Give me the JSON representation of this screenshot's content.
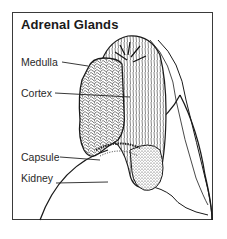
{
  "diagram": {
    "title": "Adrenal Glands",
    "labels": [
      {
        "text": "Medulla",
        "x": 21,
        "y": 61,
        "line_to": [
          88,
          66
        ]
      },
      {
        "text": "Cortex",
        "x": 21,
        "y": 92,
        "line_to": [
          78,
          97
        ]
      },
      {
        "text": "Capsule",
        "x": 21,
        "y": 156,
        "line_to": [
          100,
          160
        ]
      },
      {
        "text": "Kidney",
        "x": 21,
        "y": 177,
        "line_to": [
          108,
          182
        ]
      }
    ],
    "colors": {
      "ink": "#1a1a1a",
      "border": "#3a3a3a",
      "background": "#ffffff"
    }
  }
}
